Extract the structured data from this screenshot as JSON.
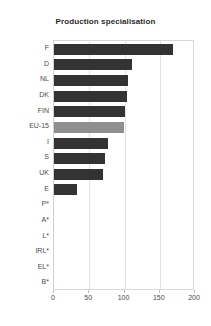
{
  "chart_data": {
    "type": "bar",
    "orientation": "horizontal",
    "title": "Production specialisation",
    "xlabel": "",
    "ylabel": "",
    "xlim": [
      0,
      200
    ],
    "xticks": [
      0,
      50,
      100,
      150,
      200
    ],
    "grid": true,
    "categories": [
      "F",
      "D",
      "NL",
      "DK",
      "FIN",
      "EU-15",
      "I",
      "S",
      "UK",
      "E",
      "P*",
      "A*",
      "L*",
      "IRL*",
      "EL*",
      "B*"
    ],
    "values": [
      169,
      110,
      105,
      103,
      101,
      99,
      77,
      72,
      69,
      33,
      0,
      0,
      0,
      0,
      0,
      0
    ],
    "highlight_category": "EU-15",
    "colors": {
      "bar": "#333333",
      "bar_highlight": "#8f8f8f",
      "grid": "#e3e3e3",
      "axis": "#d9d9d9",
      "text": "#4a4a4a",
      "title": "#2b2b2b"
    }
  }
}
